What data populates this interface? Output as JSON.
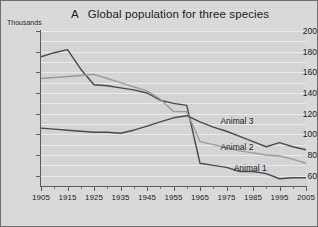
{
  "chart_data": {
    "type": "line",
    "title": "Global population for three species",
    "panel_label": "A",
    "ylabel": "Thousands",
    "xlabel": "",
    "ylim": [
      50,
      200
    ],
    "xlim": [
      1905,
      2005
    ],
    "grid": true,
    "gridline_step": 10,
    "legend_position": "inline-right",
    "yticks": [
      200,
      180,
      160,
      140,
      120,
      100,
      80,
      60
    ],
    "xticks": [
      1905,
      1915,
      1925,
      1935,
      1945,
      1955,
      1965,
      1975,
      1985,
      1995,
      2005
    ],
    "xticks_minor": [
      1910,
      1920,
      1930,
      1940,
      1950,
      1960,
      1970,
      1980,
      1990,
      2000
    ],
    "x": [
      1905,
      1910,
      1915,
      1920,
      1925,
      1930,
      1935,
      1940,
      1945,
      1950,
      1955,
      1960,
      1965,
      1970,
      1975,
      1980,
      1985,
      1990,
      1995,
      2000,
      2005
    ],
    "series": [
      {
        "name": "Animal 1",
        "color": "#4a4a4a",
        "values": [
          175,
          179,
          182,
          163,
          148,
          147,
          145,
          143,
          140,
          133,
          130,
          128,
          72,
          70,
          68,
          64,
          64,
          62,
          57,
          58,
          58
        ]
      },
      {
        "name": "Animal 2",
        "color": "#9a9a9a",
        "values": [
          154,
          155,
          156,
          157,
          158,
          154,
          150,
          146,
          142,
          134,
          122,
          122,
          93,
          90,
          87,
          84,
          82,
          80,
          79,
          76,
          72
        ]
      },
      {
        "name": "Animal 3",
        "color": "#4a4a4a",
        "values": [
          106,
          105,
          104,
          103,
          102,
          102,
          101,
          104,
          108,
          112,
          116,
          118,
          112,
          107,
          103,
          98,
          93,
          88,
          92,
          88,
          85
        ]
      }
    ],
    "annotations": [
      {
        "text": "Animal 3",
        "x": 1981,
        "y": 113
      },
      {
        "text": "Animal 2",
        "x": 1981,
        "y": 88
      },
      {
        "text": "Animal 1",
        "x": 1986,
        "y": 67
      }
    ]
  },
  "colors": {
    "page_background": "#d9d9d9",
    "plot_background": "#d4d4d4",
    "gridline": "#ebebeb",
    "axis": "#5d5d5d",
    "border": "#6f6f6f",
    "text": "#1b1b1b"
  }
}
